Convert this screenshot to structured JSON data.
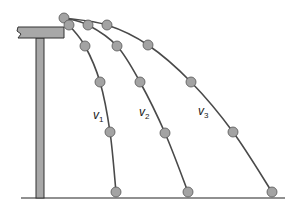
{
  "diagram": {
    "title": "",
    "colors": {
      "line": "#4a4a4a",
      "dot_fill": "#a3a3a3",
      "dot_stroke": "#555555",
      "table_fill": "#a8a8a8",
      "table_stroke": "#333333",
      "ground": "#222222"
    },
    "start_point": [
      64,
      18
    ],
    "trajectories": [
      {
        "label": "v",
        "subscript": "1",
        "label_pos": [
          93,
          119
        ],
        "points": [
          [
            64,
            18
          ],
          [
            69,
            25
          ],
          [
            85,
            46
          ],
          [
            100,
            82
          ],
          [
            110,
            132
          ],
          [
            116,
            192
          ]
        ]
      },
      {
        "label": "v",
        "subscript": "2",
        "label_pos": [
          139,
          116
        ],
        "points": [
          [
            64,
            18
          ],
          [
            88,
            25
          ],
          [
            117,
            46
          ],
          [
            140,
            82
          ],
          [
            165,
            133
          ],
          [
            188,
            192
          ]
        ]
      },
      {
        "label": "v",
        "subscript": "3",
        "label_pos": [
          198,
          115
        ],
        "points": [
          [
            64,
            18
          ],
          [
            107,
            25
          ],
          [
            148,
            45
          ],
          [
            191,
            82
          ],
          [
            233,
            132
          ],
          [
            272,
            192
          ]
        ]
      }
    ],
    "ground_y": 198,
    "ground_x": [
      21,
      285
    ]
  }
}
